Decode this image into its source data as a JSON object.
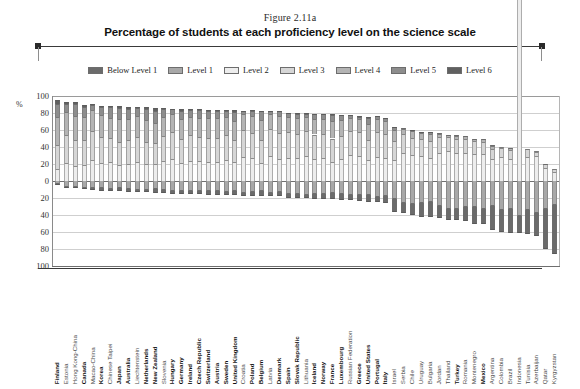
{
  "header": {
    "figure_number": "Figure 2.11a",
    "title": "Percentage of students at each proficiency level on the science scale"
  },
  "legend": {
    "position": "top",
    "items": [
      {
        "label": "Below Level 1",
        "color": "#6b6b6b"
      },
      {
        "label": "Level 1",
        "color": "#a8a8a8"
      },
      {
        "label": "Level 2",
        "color": "#ededed"
      },
      {
        "label": "Level 3",
        "color": "#d6d6d6"
      },
      {
        "label": "Level 4",
        "color": "#b4b4b4"
      },
      {
        "label": "Level 5",
        "color": "#8d8d8d"
      },
      {
        "label": "Level 6",
        "color": "#606060"
      }
    ]
  },
  "axis": {
    "y_unit": "%",
    "y_ticks": [
      "100",
      "80",
      "60",
      "40",
      "20",
      "0",
      "20",
      "40",
      "60",
      "80",
      "100"
    ],
    "y_values": [
      100,
      80,
      60,
      40,
      20,
      0,
      -20,
      -40,
      -60,
      -80,
      -100
    ]
  },
  "chart_data": {
    "type": "bar",
    "subtype": "diverging-stacked-bar",
    "title": "Percentage of students at each proficiency level on the science scale",
    "figure_number": "Figure 2.11a",
    "xlabel": "",
    "ylabel": "%",
    "ylim": [
      -100,
      100
    ],
    "grid": true,
    "legend_position": "top",
    "note": "Segments above zero (Levels 2-6) stack upward; segments below zero (Level 1 and Below Level 1) stack downward.",
    "series": [
      {
        "name": "Below Level 1",
        "color": "#6b6b6b",
        "direction": "down"
      },
      {
        "name": "Level 1",
        "color": "#a8a8a8",
        "direction": "down"
      },
      {
        "name": "Level 2",
        "color": "#ededed",
        "direction": "up"
      },
      {
        "name": "Level 3",
        "color": "#d6d6d6",
        "direction": "up"
      },
      {
        "name": "Level 4",
        "color": "#b4b4b4",
        "direction": "up"
      },
      {
        "name": "Level 5",
        "color": "#8d8d8d",
        "direction": "up"
      },
      {
        "name": "Level 6",
        "color": "#606060",
        "direction": "up"
      }
    ],
    "categories": [
      "Finland",
      "Estonia",
      "Hong Kong-China",
      "Canada",
      "Macao-China",
      "Korea",
      "Chinese Taipei",
      "Japan",
      "Australia",
      "Liechtenstein",
      "Netherlands",
      "New Zealand",
      "Slovenia",
      "Hungary",
      "Germany",
      "Ireland",
      "Czech Republic",
      "Switzerland",
      "Austria",
      "Sweden",
      "United Kingdom",
      "Croatia",
      "Poland",
      "Belgium",
      "Latvia",
      "Denmark",
      "Spain",
      "Slovak Republic",
      "Lithuania",
      "Iceland",
      "Norway",
      "France",
      "Luxembourg",
      "Russian Federation",
      "Greece",
      "United States",
      "Portugal",
      "Italy",
      "Israel",
      "Serbia",
      "Chile",
      "Uruguay",
      "Bulgaria",
      "Jordan",
      "Thailand",
      "Turkey",
      "Romania",
      "Montenegro",
      "Mexico",
      "Argentina",
      "Colombia",
      "Brazil",
      "Indonesia",
      "Tunisia",
      "Azerbaijan",
      "Qatar",
      "Kyrgyzstan"
    ],
    "oecd_members": [
      "Finland",
      "Canada",
      "Korea",
      "Japan",
      "Australia",
      "Netherlands",
      "New Zealand",
      "Hungary",
      "Germany",
      "Ireland",
      "Czech Republic",
      "Switzerland",
      "Austria",
      "Sweden",
      "United Kingdom",
      "Poland",
      "Belgium",
      "Denmark",
      "Spain",
      "Slovak Republic",
      "Iceland",
      "Norway",
      "France",
      "Luxembourg",
      "Greece",
      "United States",
      "Portugal",
      "Italy",
      "Turkey",
      "Mexico"
    ],
    "values": {
      "Finland": {
        "below1": 1.1,
        "l1": 3.6,
        "l2": 13.6,
        "l3": 29.1,
        "l4": 32.2,
        "l5": 16.0,
        "l6": 3.9
      },
      "Estonia": {
        "below1": 1.0,
        "l1": 6.7,
        "l2": 21.0,
        "l3": 33.7,
        "l4": 26.2,
        "l5": 10.1,
        "l6": 1.4
      },
      "Hong Kong-China": {
        "below1": 1.7,
        "l1": 7.0,
        "l2": 18.0,
        "l3": 29.7,
        "l4": 28.7,
        "l5": 13.9,
        "l6": 2.1
      },
      "Canada": {
        "below1": 2.2,
        "l1": 7.8,
        "l2": 19.1,
        "l3": 29.2,
        "l4": 27.0,
        "l5": 12.0,
        "l6": 2.4
      },
      "Macao-China": {
        "below1": 1.4,
        "l1": 8.7,
        "l2": 25.1,
        "l3": 34.1,
        "l4": 24.3,
        "l5": 6.2,
        "l6": 0.4
      },
      "Korea": {
        "below1": 2.5,
        "l1": 8.7,
        "l2": 21.2,
        "l3": 30.2,
        "l4": 26.0,
        "l5": 9.2,
        "l6": 1.1
      },
      "Chinese Taipei": {
        "below1": 1.9,
        "l1": 9.8,
        "l2": 22.9,
        "l3": 27.3,
        "l4": 24.0,
        "l5": 12.9,
        "l6": 1.7
      },
      "Japan": {
        "below1": 3.2,
        "l1": 8.8,
        "l2": 18.5,
        "l3": 27.5,
        "l4": 27.0,
        "l5": 12.4,
        "l6": 2.6
      },
      "Australia": {
        "below1": 3.0,
        "l1": 9.8,
        "l2": 20.2,
        "l3": 27.7,
        "l4": 24.6,
        "l5": 11.8,
        "l6": 2.8
      },
      "Liechtenstein": {
        "below1": 2.4,
        "l1": 10.5,
        "l2": 21.9,
        "l3": 29.7,
        "l4": 25.1,
        "l5": 9.1,
        "l6": 1.2
      },
      "Netherlands": {
        "below1": 2.3,
        "l1": 10.6,
        "l2": 20.4,
        "l3": 25.9,
        "l4": 26.0,
        "l5": 12.6,
        "l6": 2.1
      },
      "New Zealand": {
        "below1": 4.0,
        "l1": 9.6,
        "l2": 19.7,
        "l3": 25.1,
        "l4": 24.0,
        "l5": 13.6,
        "l6": 3.9
      },
      "Slovenia": {
        "below1": 2.8,
        "l1": 11.1,
        "l2": 23.1,
        "l3": 29.4,
        "l4": 23.3,
        "l5": 9.1,
        "l6": 1.2
      },
      "Hungary": {
        "below1": 2.7,
        "l1": 12.3,
        "l2": 26.0,
        "l3": 31.4,
        "l4": 21.0,
        "l5": 6.2,
        "l6": 0.5
      },
      "Germany": {
        "below1": 4.1,
        "l1": 11.3,
        "l2": 21.4,
        "l3": 27.9,
        "l4": 23.6,
        "l5": 10.0,
        "l6": 1.8
      },
      "Ireland": {
        "below1": 3.5,
        "l1": 12.0,
        "l2": 24.0,
        "l3": 29.7,
        "l4": 21.9,
        "l5": 7.7,
        "l6": 1.1
      },
      "Czech Republic": {
        "below1": 3.5,
        "l1": 12.1,
        "l2": 23.4,
        "l3": 27.8,
        "l4": 22.8,
        "l5": 9.0,
        "l6": 1.4
      },
      "Switzerland": {
        "below1": 4.5,
        "l1": 11.6,
        "l2": 22.5,
        "l3": 28.3,
        "l4": 23.4,
        "l5": 8.6,
        "l6": 1.1
      },
      "Austria": {
        "below1": 4.3,
        "l1": 12.0,
        "l2": 22.6,
        "l3": 28.3,
        "l4": 23.0,
        "l5": 8.8,
        "l6": 1.0
      },
      "Sweden": {
        "below1": 3.8,
        "l1": 12.6,
        "l2": 25.0,
        "l3": 29.5,
        "l4": 21.1,
        "l5": 7.1,
        "l6": 0.9
      },
      "United Kingdom": {
        "below1": 4.8,
        "l1": 11.9,
        "l2": 21.8,
        "l3": 25.9,
        "l4": 23.0,
        "l5": 10.9,
        "l6": 1.7
      },
      "Croatia": {
        "below1": 3.3,
        "l1": 13.9,
        "l2": 28.1,
        "l3": 31.6,
        "l4": 18.7,
        "l5": 4.2,
        "l6": 0.2
      },
      "Poland": {
        "below1": 3.8,
        "l1": 13.3,
        "l2": 27.5,
        "l3": 29.4,
        "l4": 19.3,
        "l5": 6.1,
        "l6": 0.7
      },
      "Belgium": {
        "below1": 5.3,
        "l1": 11.8,
        "l2": 21.4,
        "l3": 27.0,
        "l4": 23.8,
        "l5": 9.7,
        "l6": 1.0
      },
      "Latvia": {
        "below1": 3.6,
        "l1": 13.7,
        "l2": 29.0,
        "l3": 32.1,
        "l4": 17.7,
        "l5": 3.7,
        "l6": 0.2
      },
      "Denmark": {
        "below1": 4.3,
        "l1": 13.1,
        "l2": 26.0,
        "l3": 30.4,
        "l4": 19.7,
        "l5": 6.1,
        "l6": 0.5
      },
      "Spain": {
        "below1": 4.7,
        "l1": 14.9,
        "l2": 27.4,
        "l3": 30.2,
        "l4": 17.9,
        "l5": 4.5,
        "l6": 0.3
      },
      "Slovak Republic": {
        "below1": 5.2,
        "l1": 15.0,
        "l2": 27.0,
        "l3": 28.0,
        "l4": 18.7,
        "l5": 5.6,
        "l6": 0.5
      },
      "Lithuania": {
        "below1": 4.3,
        "l1": 16.0,
        "l2": 29.6,
        "l3": 29.1,
        "l4": 16.7,
        "l5": 4.0,
        "l6": 0.3
      },
      "Iceland": {
        "below1": 5.8,
        "l1": 14.9,
        "l2": 26.2,
        "l3": 28.5,
        "l4": 18.6,
        "l5": 5.5,
        "l6": 0.5
      },
      "Norway": {
        "below1": 5.9,
        "l1": 15.2,
        "l2": 27.2,
        "l3": 28.5,
        "l4": 17.8,
        "l5": 5.0,
        "l6": 0.4
      },
      "France": {
        "below1": 6.6,
        "l1": 14.5,
        "l2": 22.8,
        "l3": 27.2,
        "l4": 20.9,
        "l5": 7.2,
        "l6": 0.8
      },
      "Luxembourg": {
        "below1": 6.5,
        "l1": 15.6,
        "l2": 25.4,
        "l3": 27.4,
        "l4": 19.4,
        "l5": 5.4,
        "l6": 0.4
      },
      "Russian Federation": {
        "below1": 5.2,
        "l1": 17.0,
        "l2": 30.2,
        "l3": 28.3,
        "l4": 15.1,
        "l5": 3.7,
        "l6": 0.5
      },
      "Greece": {
        "below1": 7.2,
        "l1": 16.9,
        "l2": 29.2,
        "l3": 29.0,
        "l4": 15.0,
        "l5": 2.6,
        "l6": 0.1
      },
      "United States": {
        "below1": 7.6,
        "l1": 16.8,
        "l2": 24.2,
        "l3": 24.0,
        "l4": 18.3,
        "l5": 7.5,
        "l6": 1.5
      },
      "Portugal": {
        "below1": 5.8,
        "l1": 18.7,
        "l2": 28.8,
        "l3": 28.8,
        "l4": 15.5,
        "l5": 2.9,
        "l6": 0.1
      },
      "Italy": {
        "below1": 7.3,
        "l1": 18.0,
        "l2": 27.6,
        "l3": 27.4,
        "l4": 15.1,
        "l5": 4.2,
        "l6": 0.4
      },
      "Israel": {
        "below1": 14.9,
        "l1": 21.2,
        "l2": 25.0,
        "l3": 22.4,
        "l4": 12.4,
        "l5": 3.7,
        "l6": 0.4
      },
      "Serbia": {
        "below1": 11.9,
        "l1": 26.1,
        "l2": 33.4,
        "l3": 22.4,
        "l4": 5.8,
        "l5": 0.4,
        "l6": 0.0
      },
      "Chile": {
        "below1": 13.1,
        "l1": 26.6,
        "l2": 30.7,
        "l3": 20.2,
        "l4": 8.0,
        "l5": 1.3,
        "l6": 0.1
      },
      "Uruguay": {
        "below1": 16.7,
        "l1": 25.4,
        "l2": 29.0,
        "l3": 20.2,
        "l4": 7.5,
        "l5": 1.2,
        "l6": 0.1
      },
      "Bulgaria": {
        "below1": 18.3,
        "l1": 24.2,
        "l2": 27.0,
        "l3": 20.6,
        "l4": 8.2,
        "l5": 1.5,
        "l6": 0.2
      },
      "Jordan": {
        "below1": 14.4,
        "l1": 29.6,
        "l2": 33.4,
        "l3": 18.7,
        "l4": 3.7,
        "l5": 0.2,
        "l6": 0.0
      },
      "Thailand": {
        "below1": 12.6,
        "l1": 33.5,
        "l2": 35.8,
        "l3": 15.5,
        "l4": 2.4,
        "l5": 0.1,
        "l6": 0.0
      },
      "Turkey": {
        "below1": 12.9,
        "l1": 33.5,
        "l2": 33.4,
        "l3": 16.5,
        "l4": 3.5,
        "l5": 0.3,
        "l6": 0.0
      },
      "Romania": {
        "below1": 16.0,
        "l1": 30.9,
        "l2": 33.1,
        "l3": 16.6,
        "l4": 3.2,
        "l5": 0.2,
        "l6": 0.0
      },
      "Montenegro": {
        "below1": 19.9,
        "l1": 30.4,
        "l2": 31.5,
        "l3": 15.4,
        "l4": 2.7,
        "l5": 0.1,
        "l6": 0.0
      },
      "Mexico": {
        "below1": 18.2,
        "l1": 32.8,
        "l2": 32.2,
        "l3": 14.2,
        "l4": 2.5,
        "l5": 0.1,
        "l6": 0.0
      },
      "Argentina": {
        "below1": 28.3,
        "l1": 29.9,
        "l2": 25.5,
        "l3": 12.6,
        "l4": 3.4,
        "l5": 0.4,
        "l6": 0.0
      },
      "Colombia": {
        "below1": 26.2,
        "l1": 34.0,
        "l2": 28.6,
        "l3": 10.0,
        "l4": 1.2,
        "l5": 0.0,
        "l6": 0.0
      },
      "Brazil": {
        "below1": 27.9,
        "l1": 33.1,
        "l2": 26.3,
        "l3": 10.4,
        "l4": 2.1,
        "l5": 0.2,
        "l6": 0.0
      },
      "Indonesia": {
        "below1": 20.3,
        "l1": 41.3,
        "l2": 944,
        "l3": 0,
        "l4": 0,
        "l5": 0,
        "l6": 0
      },
      "Tunisia": {
        "below1": 27.7,
        "l1": 34.1,
        "l2": 28.2,
        "l3": 8.9,
        "l4": 1.1,
        "l5": 0.0,
        "l6": 0.0
      },
      "Azerbaijan": {
        "below1": 27.4,
        "l1": 37.5,
        "l2": 29.0,
        "l3": 5.7,
        "l4": 0.4,
        "l5": 0.0,
        "l6": 0.0
      },
      "Qatar": {
        "below1": 47.1,
        "l1": 32.4,
        "l2": 14.9,
        "l3": 4.6,
        "l4": 0.9,
        "l5": 0.1,
        "l6": 0.0
      },
      "Kyrgyzstan": {
        "below1": 57.9,
        "l1": 28.1,
        "l2": 11.0,
        "l3": 2.7,
        "l4": 0.3,
        "l5": 0.0,
        "l6": 0.0
      }
    }
  }
}
